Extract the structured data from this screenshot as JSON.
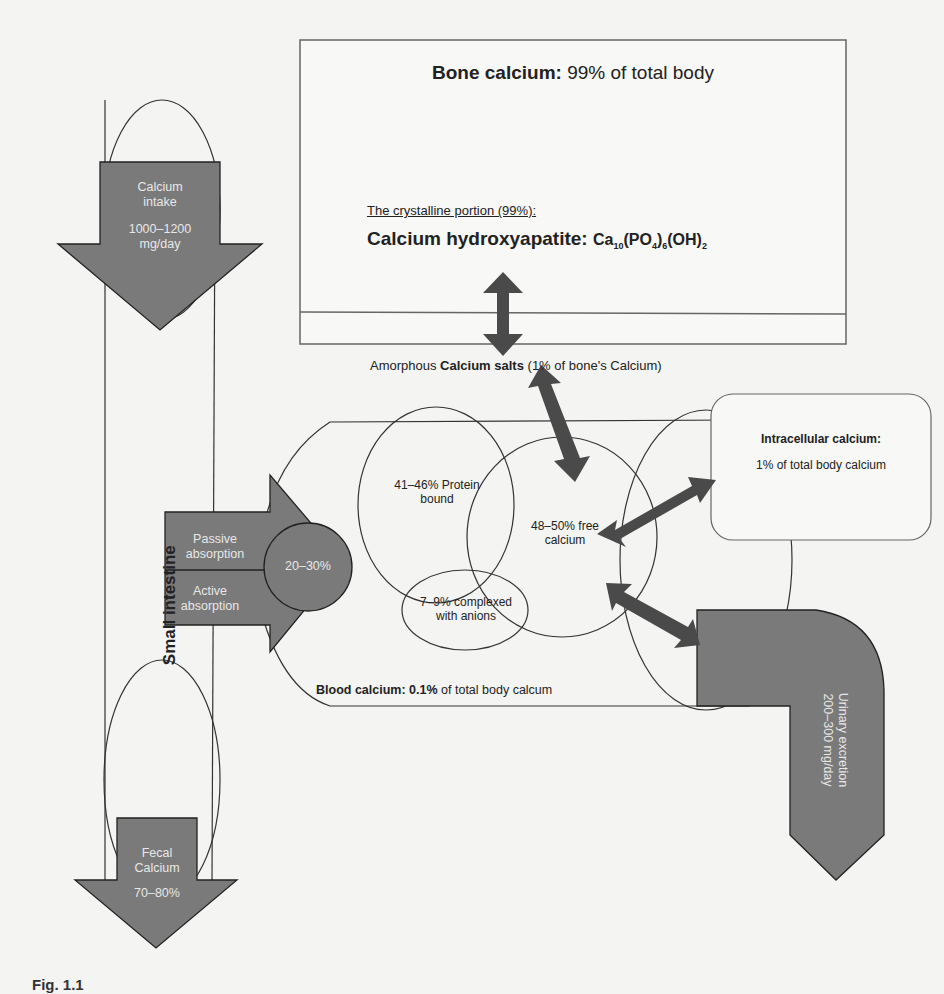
{
  "bone": {
    "title_bold": "Bone calcium:",
    "title_pct": "99%",
    "title_rest": "of total body",
    "crystalline_label": "The crystalline portion (99%):",
    "hydroxyapatite_bold": "Calcium hydroxyapatite:",
    "formula": "Ca10(PO4)6(OH)2",
    "amorphous_pre": "Amorphous",
    "amorphous_bold": "Calcium salts",
    "amorphous_post": "(1% of bone's Calcium)"
  },
  "intake": {
    "line1": "Calcium",
    "line2": "intake",
    "amount": "1000–1200",
    "unit": "mg/day"
  },
  "small_intestine": {
    "label": "Small intestine"
  },
  "absorption": {
    "passive_1": "Passive",
    "passive_2": "absorption",
    "active_1": "Active",
    "active_2": "absorption",
    "pct": "20–30%"
  },
  "blood": {
    "protein_1": "41–46% Protein",
    "protein_2": "bound",
    "free_1": "48–50% free",
    "free_2": "calcium",
    "complexed_1": "7–9% complexed",
    "complexed_2": "with anions",
    "label_bold": "Blood calcium:",
    "label_pct": "0.1%",
    "label_rest": "of total body calcum"
  },
  "intracellular": {
    "title": "Intracellular calcium:",
    "value": "1% of total body calcium"
  },
  "urinary": {
    "line1": "Urinary excretion",
    "line2": "200–300 mg/day"
  },
  "fecal": {
    "line1": "Fecal",
    "line2": "Calcium",
    "pct": "70–80%"
  },
  "caption": {
    "text": "Fig. 1.1"
  },
  "colors": {
    "arrow_fill": "#7a7a7a",
    "dark_arrow": "#4a4a4a",
    "stroke": "#333333",
    "background": "#f4f4f2"
  }
}
